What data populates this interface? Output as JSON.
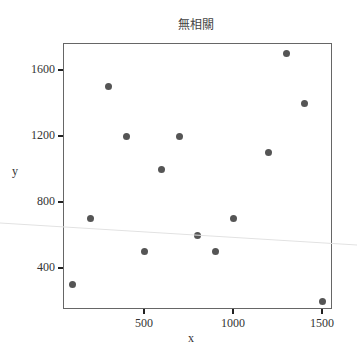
{
  "chart_data": {
    "type": "scatter",
    "title": "無相關",
    "xlabel": "x",
    "ylabel": "y",
    "xlim": [
      30,
      1560
    ],
    "ylim": [
      150,
      1770
    ],
    "xticks": [
      500,
      1000,
      1500
    ],
    "yticks": [
      400,
      800,
      1200,
      1600
    ],
    "grid": false,
    "legend": null,
    "marker_color": "#555555",
    "points": [
      {
        "x": 100,
        "y": 300
      },
      {
        "x": 200,
        "y": 700
      },
      {
        "x": 300,
        "y": 1500
      },
      {
        "x": 400,
        "y": 1200
      },
      {
        "x": 500,
        "y": 500
      },
      {
        "x": 600,
        "y": 1000
      },
      {
        "x": 700,
        "y": 1200
      },
      {
        "x": 800,
        "y": 600
      },
      {
        "x": 900,
        "y": 500
      },
      {
        "x": 1000,
        "y": 700
      },
      {
        "x": 1200,
        "y": 1100
      },
      {
        "x": 1300,
        "y": 1700
      },
      {
        "x": 1400,
        "y": 1400
      },
      {
        "x": 1500,
        "y": 200
      }
    ]
  },
  "labels": {
    "title": "無相關",
    "x_axis": "x",
    "y_axis": "y",
    "xtick_labels": [
      "500",
      "1000",
      "1500"
    ],
    "ytick_labels": [
      "1600",
      "1200",
      "800",
      "400"
    ]
  }
}
